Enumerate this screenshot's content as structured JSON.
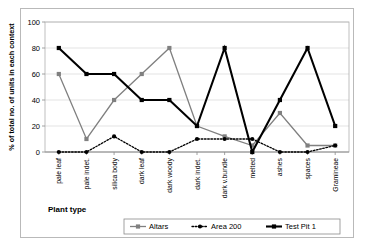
{
  "chart_data": {
    "type": "line",
    "title": "",
    "xlabel": "Plant type",
    "ylabel": "% of total no. of units in each context",
    "ylim": [
      0,
      100
    ],
    "yticks": [
      0,
      20,
      40,
      60,
      80,
      100
    ],
    "grid": true,
    "legend_position": "bottom",
    "categories": [
      "pale leaf",
      "pale indet.",
      "silica body",
      "dark leaf",
      "dark woody",
      "dark indet.",
      "dark v.bundle",
      "melted",
      "ashes",
      "spaces",
      "Gramineae"
    ],
    "series": [
      {
        "name": "Altars",
        "color": "#808080",
        "marker": "square",
        "line_style": "solid",
        "values": [
          60,
          10,
          40,
          60,
          80,
          20,
          12,
          5,
          30,
          5,
          5
        ]
      },
      {
        "name": "Area 200",
        "color": "#000000",
        "marker": "circle",
        "line_style": "dotted",
        "values": [
          0,
          0,
          12,
          0,
          0,
          10,
          10,
          10,
          0,
          0,
          5
        ]
      },
      {
        "name": "Test Pit 1",
        "color": "#000000",
        "marker": "square",
        "line_style": "solid-bold",
        "values": [
          80,
          60,
          60,
          40,
          40,
          20,
          80,
          0,
          40,
          80,
          20
        ]
      }
    ]
  },
  "legend": {
    "items": [
      {
        "label": "Altars"
      },
      {
        "label": "Area 200"
      },
      {
        "label": "Test Pit 1"
      }
    ]
  },
  "axis": {
    "y_title": "% of total no. of units in each context",
    "x_title": "Plant type",
    "y_tick_labels": [
      "0",
      "20",
      "40",
      "60",
      "80",
      "100"
    ]
  }
}
